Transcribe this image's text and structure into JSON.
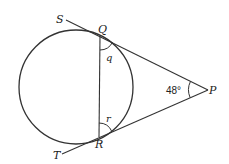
{
  "diagram": {
    "labels": {
      "S": "S",
      "Q": "Q",
      "P": "P",
      "R": "R",
      "T": "T",
      "angle_q": "q",
      "angle_r": "r",
      "angle_P": "48°"
    },
    "points": {
      "S": [
        66,
        20
      ],
      "Q": [
        100,
        36
      ],
      "P": [
        208,
        90
      ],
      "R": [
        99,
        137
      ],
      "T": [
        62,
        154
      ]
    },
    "circle": {
      "cx": 76,
      "cy": 87,
      "r": 57
    },
    "colors": {
      "stroke": "#333333",
      "background": "#ffffff"
    }
  }
}
